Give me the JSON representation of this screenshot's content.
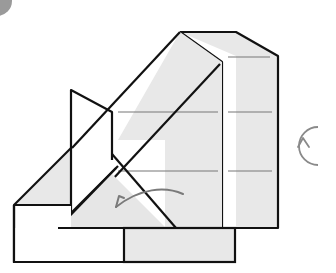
{
  "diagram": {
    "type": "origami-fold-step",
    "colors": {
      "paper_fill": "#e8e8e8",
      "white_fill": "#ffffff",
      "outline": "#111111",
      "crease": "#777777",
      "arrow": "#7a7a7a",
      "corner_badge": "#9a9a9a"
    },
    "symbols": {
      "fold_arrow": "curved-fold-arrow",
      "rotate": "rotate-model-icon"
    }
  }
}
